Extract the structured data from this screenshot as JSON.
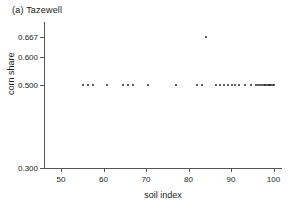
{
  "chart_data": {
    "type": "scatter",
    "title": "(a) Tazewell",
    "xlabel": "soil index",
    "ylabel": "corn share",
    "xlim": [
      46,
      102
    ],
    "ylim": [
      0.3,
      0.69
    ],
    "grid": false,
    "legend": null,
    "xticks": [
      50,
      60,
      70,
      80,
      90,
      100
    ],
    "xtick_labels": [
      "50",
      "60",
      "70",
      "80",
      "90",
      "100"
    ],
    "yticks": [
      0.3,
      0.5,
      0.6,
      0.667
    ],
    "ytick_labels": [
      "0.300",
      "0.500",
      "0.600",
      "0.667"
    ],
    "marker": "point",
    "marker_color": "#2b2b2b",
    "points": [
      {
        "x": 55.2,
        "y": 0.5
      },
      {
        "x": 56.4,
        "y": 0.5
      },
      {
        "x": 57.6,
        "y": 0.5
      },
      {
        "x": 60.8,
        "y": 0.5
      },
      {
        "x": 64.6,
        "y": 0.5
      },
      {
        "x": 65.8,
        "y": 0.5
      },
      {
        "x": 67.0,
        "y": 0.5
      },
      {
        "x": 70.4,
        "y": 0.5
      },
      {
        "x": 77.0,
        "y": 0.5
      },
      {
        "x": 82.0,
        "y": 0.5
      },
      {
        "x": 83.2,
        "y": 0.5
      },
      {
        "x": 84.2,
        "y": 0.667
      },
      {
        "x": 86.4,
        "y": 0.5
      },
      {
        "x": 87.4,
        "y": 0.5
      },
      {
        "x": 88.4,
        "y": 0.5
      },
      {
        "x": 89.3,
        "y": 0.5
      },
      {
        "x": 90.2,
        "y": 0.5
      },
      {
        "x": 91.0,
        "y": 0.5
      },
      {
        "x": 91.8,
        "y": 0.5
      },
      {
        "x": 93.2,
        "y": 0.5
      },
      {
        "x": 94.6,
        "y": 0.5
      },
      {
        "x": 95.8,
        "y": 0.5
      },
      {
        "x": 96.4,
        "y": 0.5
      },
      {
        "x": 96.9,
        "y": 0.5
      },
      {
        "x": 97.3,
        "y": 0.5
      },
      {
        "x": 97.7,
        "y": 0.5
      },
      {
        "x": 98.0,
        "y": 0.5
      },
      {
        "x": 98.3,
        "y": 0.5
      },
      {
        "x": 98.6,
        "y": 0.5
      },
      {
        "x": 98.9,
        "y": 0.5
      },
      {
        "x": 99.2,
        "y": 0.5
      },
      {
        "x": 99.5,
        "y": 0.5
      },
      {
        "x": 99.8,
        "y": 0.5
      },
      {
        "x": 100.1,
        "y": 0.5
      }
    ]
  }
}
